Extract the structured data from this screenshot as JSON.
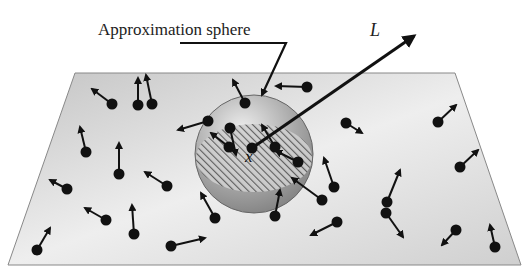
{
  "labels": {
    "sphere": "Approximation sphere",
    "vector": "L",
    "center": "x"
  },
  "colors": {
    "plane_light": "#f4f4f4",
    "plane_dark": "#c8c8c8",
    "sphere": "#9c9c9c",
    "particle": "#111111"
  },
  "particles": [
    [
      112,
      104,
      92,
      89
    ],
    [
      138,
      105,
      138,
      78
    ],
    [
      152,
      104,
      146,
      75
    ],
    [
      86,
      152,
      80,
      127
    ],
    [
      67,
      189,
      50,
      180
    ],
    [
      106,
      220,
      85,
      208
    ],
    [
      119,
      174,
      119,
      143
    ],
    [
      167,
      186,
      145,
      172
    ],
    [
      134,
      234,
      132,
      205
    ],
    [
      37,
      250,
      50,
      228
    ],
    [
      171,
      246,
      205,
      238
    ],
    [
      245,
      103,
      233,
      80
    ],
    [
      208,
      121,
      178,
      130
    ],
    [
      230,
      128,
      236,
      155
    ],
    [
      229,
      147,
      211,
      133
    ],
    [
      307,
      87,
      276,
      86
    ],
    [
      275,
      147,
      262,
      125
    ],
    [
      298,
      162,
      276,
      151
    ],
    [
      252,
      148,
      250,
      150
    ],
    [
      346,
      123,
      362,
      133
    ],
    [
      334,
      187,
      324,
      158
    ],
    [
      387,
      202,
      400,
      170
    ],
    [
      386,
      213,
      403,
      237
    ],
    [
      337,
      222,
      311,
      235
    ],
    [
      456,
      230,
      442,
      245
    ],
    [
      438,
      122,
      456,
      105
    ],
    [
      460,
      167,
      478,
      150
    ],
    [
      495,
      247,
      490,
      225
    ],
    [
      275,
      216,
      280,
      190
    ],
    [
      215,
      218,
      201,
      193
    ],
    [
      322,
      200,
      292,
      178
    ]
  ]
}
